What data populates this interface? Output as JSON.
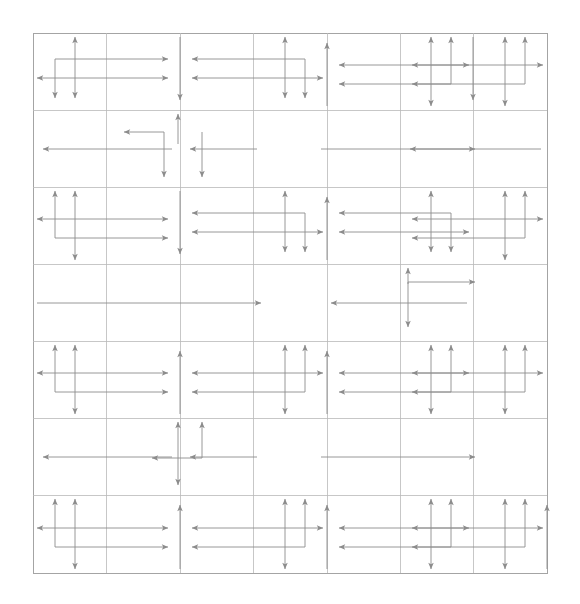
{
  "figure": {
    "background_color": "#ffffff",
    "canvas": {
      "width": 580,
      "height": 604
    }
  },
  "chart_data": {
    "type": "diagram",
    "grid": {
      "x0": 33,
      "y0": 33,
      "x1": 547,
      "y1": 573,
      "major_x": [
        33,
        106,
        180,
        253,
        327,
        400,
        473,
        547
      ],
      "major_y": [
        33,
        110,
        187,
        264,
        341,
        418,
        495,
        573
      ],
      "minor_x": [
        142,
        162,
        217,
        290,
        364,
        437,
        510
      ],
      "minor_y": [
        71,
        148,
        225,
        302,
        379,
        456,
        534
      ],
      "line_color": "#b9b9b9",
      "border_color": "#9a9a9a",
      "line_width": 0.8,
      "grid_on": true
    },
    "arrow_style": {
      "stroke": "#8c8c8c",
      "stroke_width": 0.9,
      "head_length": 7,
      "head_width": 5
    },
    "motifs": [
      {
        "id": "m-r1-c1",
        "kind": "double-bracket-down",
        "row": 1,
        "col": 1
      },
      {
        "id": "m-r1-c2",
        "kind": "single-stem-down",
        "row": 1,
        "col": 2
      },
      {
        "id": "m-r1-c3",
        "kind": "double-bracket-down-left",
        "row": 1,
        "col": 3
      },
      {
        "id": "m-r1-c4",
        "kind": "single-stem-up",
        "row": 1,
        "col": 4
      },
      {
        "id": "m-r1-c5",
        "kind": "double-bracket-up",
        "row": 1,
        "col": 5
      },
      {
        "id": "m-r1-c6",
        "kind": "single-stem-down",
        "row": 1,
        "col": 6
      },
      {
        "id": "m-r1-c7",
        "kind": "double-bracket-up-right",
        "row": 1,
        "col": 7
      },
      {
        "id": "m-r2-c2",
        "kind": "hook-left-down",
        "row": 2,
        "col": 2
      },
      {
        "id": "m-r2-span",
        "kind": "long-horizontal-run",
        "row": 2,
        "col": 0
      },
      {
        "id": "m-r3-c1",
        "kind": "double-bracket-up",
        "row": 3,
        "col": 1
      },
      {
        "id": "m-r3-c3",
        "kind": "double-bracket-down",
        "row": 3,
        "col": 3
      },
      {
        "id": "m-r3-c5",
        "kind": "double-bracket-down",
        "row": 3,
        "col": 5
      },
      {
        "id": "m-r3-c7",
        "kind": "double-bracket-up",
        "row": 3,
        "col": 7
      },
      {
        "id": "m-r4-span",
        "kind": "long-horizontal-run",
        "row": 4,
        "col": 0
      },
      {
        "id": "m-r4-c6",
        "kind": "hook-right-down",
        "row": 4,
        "col": 6
      },
      {
        "id": "m-r5-c1",
        "kind": "double-bracket-up",
        "row": 5,
        "col": 1
      },
      {
        "id": "m-r5-c3",
        "kind": "double-bracket-up",
        "row": 5,
        "col": 3
      },
      {
        "id": "m-r5-c5",
        "kind": "double-bracket-up",
        "row": 5,
        "col": 5
      },
      {
        "id": "m-r5-c7",
        "kind": "double-bracket-up",
        "row": 5,
        "col": 7
      },
      {
        "id": "m-r6-c2",
        "kind": "hook-left-down",
        "row": 6,
        "col": 2
      },
      {
        "id": "m-r6-span",
        "kind": "long-horizontal-run",
        "row": 6,
        "col": 0
      },
      {
        "id": "m-r7-c1",
        "kind": "double-bracket-up",
        "row": 7,
        "col": 1
      },
      {
        "id": "m-r7-c3",
        "kind": "double-bracket-up",
        "row": 7,
        "col": 3
      },
      {
        "id": "m-r7-c5",
        "kind": "double-bracket-up",
        "row": 7,
        "col": 5
      },
      {
        "id": "m-r7-c7",
        "kind": "double-bracket-up",
        "row": 7,
        "col": 7
      }
    ]
  },
  "render": {
    "paths": [
      {
        "n": "grid-border",
        "t": "rect",
        "x": 33,
        "y": 33,
        "w": 514,
        "h": 540,
        "c": "#9a9a9a",
        "w2": 0.9
      },
      {
        "n": "grid-v-1",
        "t": "line",
        "x1": 106,
        "y1": 33,
        "x2": 106,
        "y2": 573
      },
      {
        "n": "grid-v-2",
        "t": "line",
        "x1": 180,
        "y1": 33,
        "x2": 180,
        "y2": 573
      },
      {
        "n": "grid-v-3",
        "t": "line",
        "x1": 253,
        "y1": 33,
        "x2": 253,
        "y2": 573
      },
      {
        "n": "grid-v-4",
        "t": "line",
        "x1": 327,
        "y1": 33,
        "x2": 327,
        "y2": 573
      },
      {
        "n": "grid-v-5",
        "t": "line",
        "x1": 400,
        "y1": 33,
        "x2": 400,
        "y2": 573
      },
      {
        "n": "grid-v-6",
        "t": "line",
        "x1": 473,
        "y1": 33,
        "x2": 473,
        "y2": 573
      },
      {
        "n": "grid-h-1",
        "t": "line",
        "x1": 33,
        "y1": 110,
        "x2": 547,
        "y2": 110
      },
      {
        "n": "grid-h-2",
        "t": "line",
        "x1": 33,
        "y1": 187,
        "x2": 547,
        "y2": 187
      },
      {
        "n": "grid-h-3",
        "t": "line",
        "x1": 33,
        "y1": 264,
        "x2": 547,
        "y2": 264
      },
      {
        "n": "grid-h-4",
        "t": "line",
        "x1": 33,
        "y1": 341,
        "x2": 547,
        "y2": 341
      },
      {
        "n": "grid-h-5",
        "t": "line",
        "x1": 33,
        "y1": 418,
        "x2": 547,
        "y2": 418
      },
      {
        "n": "grid-h-6",
        "t": "line",
        "x1": 33,
        "y1": 495,
        "x2": 547,
        "y2": 495
      }
    ]
  },
  "legend": {
    "visible": false,
    "entries": []
  },
  "axes": {
    "visible": false,
    "x_ticks": [],
    "y_ticks": [],
    "xlabel": "",
    "ylabel": ""
  },
  "annotations": []
}
